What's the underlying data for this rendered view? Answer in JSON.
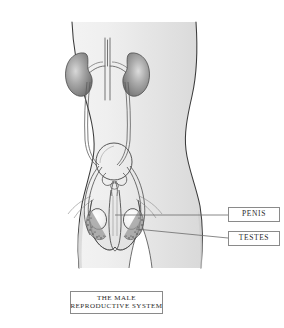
{
  "diagram": {
    "title": "THE MALE REPRODUCTIVE SYSTEM",
    "caption": {
      "line1": "THE MALE",
      "line2": "REPRODUCTIVE SYSTEM"
    },
    "labels": [
      {
        "id": "penis",
        "text": "PENIS"
      },
      {
        "id": "testes",
        "text": "TESTES"
      }
    ],
    "anatomy": [
      {
        "id": "body",
        "name": "male-torso-silhouette"
      },
      {
        "id": "kidney-left",
        "name": "left-kidney"
      },
      {
        "id": "kidney-right",
        "name": "right-kidney"
      },
      {
        "id": "ureter-left",
        "name": "left-ureter"
      },
      {
        "id": "ureter-right",
        "name": "right-ureter"
      },
      {
        "id": "aorta",
        "name": "abdominal-aorta"
      },
      {
        "id": "bladder",
        "name": "urinary-bladder"
      },
      {
        "id": "prostate",
        "name": "prostate-and-seminal-vesicles"
      },
      {
        "id": "penis",
        "name": "penis"
      },
      {
        "id": "testis-left",
        "name": "left-testis"
      },
      {
        "id": "testis-right",
        "name": "right-testis"
      },
      {
        "id": "epididymis-left",
        "name": "left-epididymis"
      },
      {
        "id": "epididymis-right",
        "name": "right-epididymis"
      },
      {
        "id": "scrotum",
        "name": "scrotum"
      }
    ],
    "colors": {
      "background": "#ffffff",
      "body_fill_light": "#f2f2f2",
      "body_fill_mid": "#e2e2e2",
      "body_fill_shadow": "#d2d2d2",
      "outline": "#2b2b2b",
      "organ_outline": "#555555",
      "kidney_dark": "#6d6d6d",
      "kidney_light": "#cfcfcf",
      "testis_fill": "#f6f6f6",
      "leader_line": "#6b6b6b",
      "box_border": "#8a8a8a",
      "text": "#2a2a2a"
    }
  }
}
